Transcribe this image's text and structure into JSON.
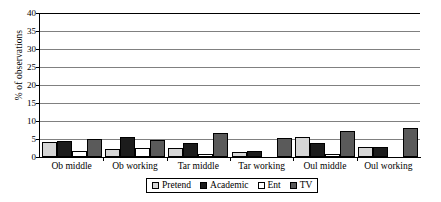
{
  "chart_data": {
    "type": "bar",
    "title": "",
    "xlabel": "",
    "ylabel": "% of observations",
    "ylim": [
      0,
      40
    ],
    "yticks": [
      0,
      5,
      10,
      15,
      20,
      25,
      30,
      35,
      40
    ],
    "grid": true,
    "legend_position": "bottom",
    "categories": [
      "Ob middle",
      "Ob working",
      "Tar middle",
      "Tar working",
      "Oul middle",
      "Oul working"
    ],
    "series": [
      {
        "name": "Pretend",
        "color": "#d6d6d6",
        "values": [
          4.1,
          2.2,
          2.4,
          1.5,
          5.5,
          2.8
        ]
      },
      {
        "name": "Academic",
        "color": "#1c1c1c",
        "values": [
          4.5,
          5.6,
          4.0,
          1.8,
          4.0,
          2.8
        ]
      },
      {
        "name": "Ent",
        "color": "#ffffff",
        "values": [
          1.7,
          2.6,
          0.8,
          0.0,
          0.7,
          0.0
        ]
      },
      {
        "name": "TV",
        "color": "#5a5a5a",
        "values": [
          5.1,
          4.8,
          6.8,
          5.2,
          7.2,
          8.0
        ]
      }
    ]
  },
  "axis": {
    "y_title": "% of observations",
    "y_tick_labels": [
      "40",
      "35",
      "30",
      "25",
      "20",
      "15",
      "10",
      "5",
      "0"
    ]
  },
  "legend": {
    "items": [
      {
        "label": "Pretend"
      },
      {
        "label": "Academic"
      },
      {
        "label": "Ent"
      },
      {
        "label": "TV"
      }
    ]
  }
}
